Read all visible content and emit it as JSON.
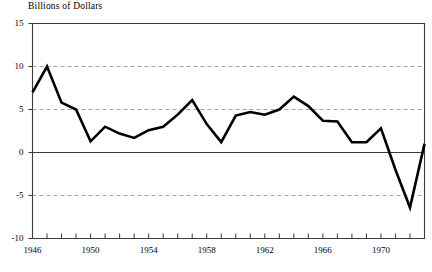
{
  "chart_data": {
    "type": "line",
    "title": "Billions of Dollars",
    "xlabel": "",
    "ylabel": "",
    "ylim": [
      -10,
      15
    ],
    "xlim": [
      1946,
      1973
    ],
    "grid": "horizontal-dashed",
    "legend": "none",
    "yticks": [
      15,
      10,
      5,
      0,
      -5,
      -10
    ],
    "ytick_labels": [
      "15",
      "10",
      "5",
      "0",
      "-5",
      "-10"
    ],
    "xticks": [
      1946,
      1947,
      1948,
      1949,
      1950,
      1951,
      1952,
      1953,
      1954,
      1955,
      1956,
      1957,
      1958,
      1959,
      1960,
      1961,
      1962,
      1963,
      1964,
      1965,
      1966,
      1967,
      1968,
      1969,
      1970,
      1971,
      1972,
      1973
    ],
    "xtick_labels_shown": [
      "1946",
      "1950",
      "1954",
      "1958",
      "1962",
      "1966",
      "1970"
    ],
    "xtick_labels_shown_values": [
      1946,
      1950,
      1954,
      1958,
      1962,
      1966,
      1970
    ],
    "x": [
      1946,
      1947,
      1948,
      1949,
      1950,
      1951,
      1952,
      1953,
      1954,
      1955,
      1956,
      1957,
      1958,
      1959,
      1960,
      1961,
      1962,
      1963,
      1964,
      1965,
      1966,
      1967,
      1968,
      1969,
      1970,
      1971,
      1972,
      1973
    ],
    "values": [
      7.0,
      10.0,
      5.8,
      5.0,
      1.3,
      3.0,
      2.2,
      1.7,
      2.6,
      3.0,
      4.4,
      6.1,
      3.3,
      1.2,
      4.3,
      4.7,
      4.4,
      5.0,
      6.5,
      5.4,
      3.7,
      3.6,
      1.2,
      1.2,
      2.8,
      -2.0,
      -6.4,
      1.0
    ],
    "series_color": "#000000",
    "line_width": 2.6,
    "gridline_color": "#999999",
    "axis_color": "#3c3c3c",
    "zero_line_value": 0
  }
}
